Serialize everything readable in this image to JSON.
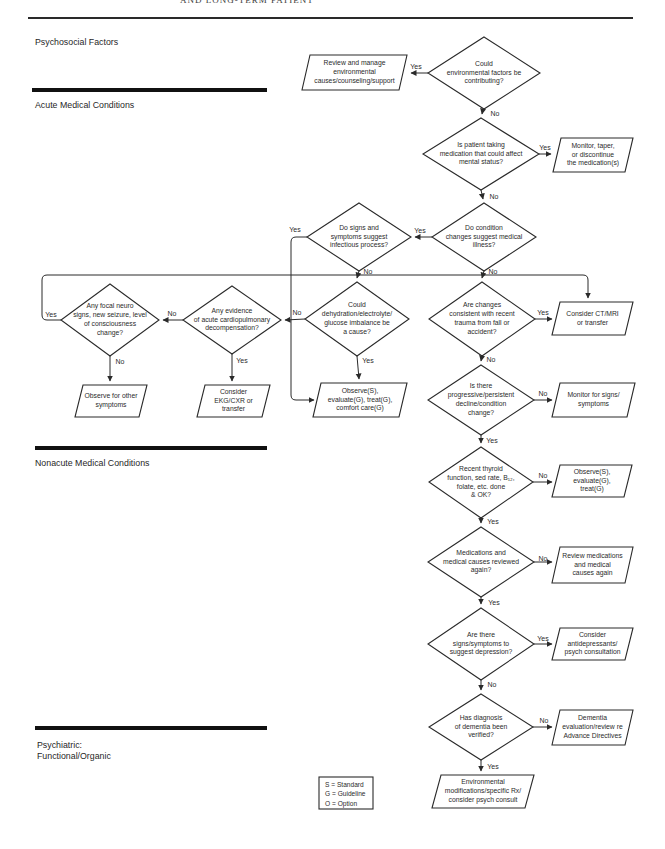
{
  "header": {
    "top_text": "AND LONG-TERM PATIENT"
  },
  "colors": {
    "line": "#2a2a2a",
    "text": "#2b2b2b",
    "background": "#ffffff"
  },
  "labels": {
    "yes": "Yes",
    "no": "No"
  },
  "sections": {
    "psychosocial": "Psychosocial Factors",
    "acute": "Acute Medical Conditions",
    "nonacute": "Nonacute Medical Conditions",
    "psychiatric": "Psychiatric:\nFunctional/Organic"
  },
  "legend": {
    "s": "S = Standard",
    "g": "G = Guideline",
    "o": "O = Option"
  },
  "nodes": {
    "q_environmental": "Could\nenvironmental factors be\ncontributing?",
    "a_review_environment": "Review and manage\nenvironmental\ncauses/counseling/support",
    "q_medication": "Is patient taking\nmedication that could affect\nmental status?",
    "a_monitor_taper": "Monitor, taper,\nor discontinue\nthe medication(s)",
    "q_medical_illness": "Do condition\nchanges suggest medical\nillness?",
    "q_infectious": "Do signs and\nsymptoms suggest\ninfectious process?",
    "q_focal_neuro": "Any focal neuro\nsigns, new seizure, level\nof consciousness\nchange?",
    "q_cardiopulmonary": "Any evidence\nof acute cardiopulmonary\ndecompensation?",
    "q_dehydration": "Could\ndehydration/electrolyte/\nglucose imbalance be\na cause?",
    "q_trauma": "Are changes\nconsistent with recent\ntrauma from fall or\naccident?",
    "a_observe_other": "Observe for other\nsymptoms",
    "a_ekg_cxr": "Consider\nEKG/CXR or\ntransfer",
    "a_observe_comfort": "Observe(S),\nevaluate(G), treat(G),\ncomfort care(G)",
    "a_ct_mri": "Consider CT/MRI\nor transfer",
    "q_decline": "Is there\nprogressive/persistent\ndecline/condition\nchange?",
    "a_monitor_signs": "Monitor for signs/\nsymptoms",
    "q_thyroid": "Recent thyroid\nfunction, sed rate, B₁₂,\nfolate, etc. done\n& OK?",
    "a_observe_evaluate_treat": "Observe(S),\nevaluate(G),\ntreat(G)",
    "q_meds_reviewed": "Medications and\nmedical causes reviewed\nagain?",
    "a_review_meds": "Review medications\nand medical\ncauses again",
    "q_depression": "Are there\nsigns/symptoms to\nsuggest depression?",
    "a_antidepressants": "Consider\nantidepressants/\npsych consultation",
    "q_dementia_verified": "Has diagnosis\nof dementia been\nverified?",
    "a_dementia_eval": "Dementia\nevaluation/review re\nAdvance Directives",
    "a_environment_mods": "Environmental\nmodifications/specific Rx/\nconsider psych consult"
  }
}
